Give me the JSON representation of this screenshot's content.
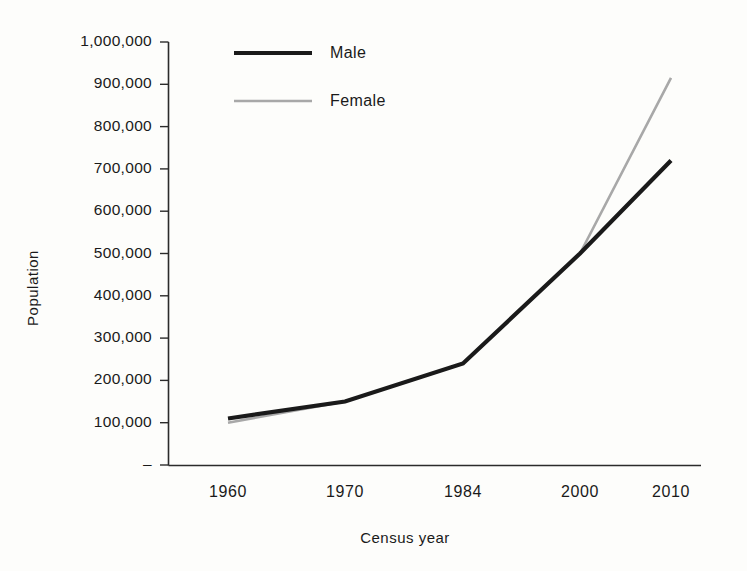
{
  "chart_data": {
    "type": "line",
    "title": "",
    "xlabel": "Census year",
    "ylabel": "Population",
    "categories": [
      "1960",
      "1970",
      "1984",
      "2000",
      "2010"
    ],
    "series": [
      {
        "name": "Male",
        "color": "#1a1a1a",
        "width": 4.2,
        "values": [
          110000,
          150000,
          240000,
          500000,
          720000
        ]
      },
      {
        "name": "Female",
        "color": "#a8a8a8",
        "width": 2.6,
        "values": [
          100000,
          150000,
          240000,
          500000,
          915000
        ]
      }
    ],
    "ylim": [
      0,
      1000000
    ],
    "ytick_values": [
      0,
      100000,
      200000,
      300000,
      400000,
      500000,
      600000,
      700000,
      800000,
      900000,
      1000000
    ],
    "ytick_labels": [
      "–",
      "100,000",
      "200,000",
      "300,000",
      "400,000",
      "500,000",
      "600,000",
      "700,000",
      "800,000",
      "900,000",
      "1,000,000"
    ],
    "grid": false,
    "legend_position": "top-left-inside"
  },
  "legend": {
    "entries": [
      {
        "label": "Male"
      },
      {
        "label": "Female"
      }
    ]
  },
  "axes": {
    "y_title": "Population",
    "x_title": "Census year"
  }
}
